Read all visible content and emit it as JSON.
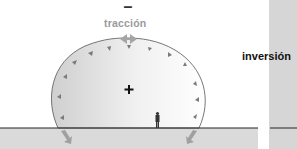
{
  "diagram": {
    "top_sign": "–",
    "top_label": "tracción",
    "center_sign": "+",
    "right_label": "inversión",
    "icons": {
      "top": "double-horizontal-arrow",
      "bottom_left": "diagonal-arrow-down-right",
      "bottom_right": "diagonal-arrow-down-left",
      "figure": "person-silhouette",
      "inner_markers": "small-triangles"
    },
    "colors": {
      "ground": "#d9d9d9",
      "dome_fill_start": "#d4d4d4",
      "dome_fill_end": "#ffffff",
      "outline": "#555555",
      "triangles": "#7a7a7a",
      "right_panel": "#d6d6d6",
      "label_gray": "#9a9a9a"
    }
  }
}
